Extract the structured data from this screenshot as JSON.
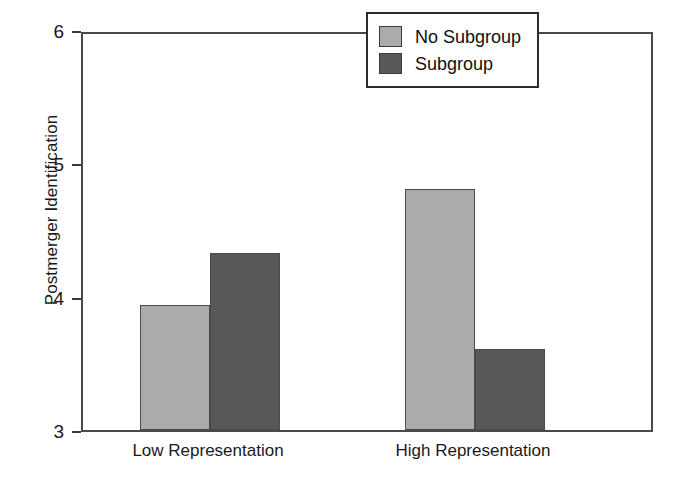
{
  "chart_data": {
    "type": "bar",
    "title": "",
    "subtitle": "",
    "xlabel": "",
    "ylabel": "Postmerger Identification",
    "categories": [
      "Low Representation",
      "High Representation"
    ],
    "series": [
      {
        "name": "No Subgroup",
        "color": "#ababab",
        "values": [
          3.94,
          4.81
        ]
      },
      {
        "name": "Subgroup",
        "color": "#585858",
        "values": [
          4.33,
          3.61
        ]
      }
    ],
    "ylim": [
      3,
      6
    ],
    "yticks": [
      3,
      4,
      5,
      6
    ],
    "ytick_labels": [
      "3",
      "4",
      "5",
      "6"
    ],
    "grid": false,
    "legend_position": "top-right",
    "frame_color": "#4a4a4a",
    "background": "#ffffff"
  },
  "legend": {
    "entries": [
      {
        "label": "No Subgroup",
        "color": "#ababab"
      },
      {
        "label": "Subgroup",
        "color": "#585858"
      }
    ]
  }
}
